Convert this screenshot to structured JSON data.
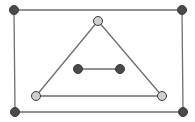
{
  "diagram": {
    "type": "graph",
    "width": 195,
    "height": 122,
    "background": "#ffffff",
    "edge_color": "#6e6e6e",
    "edge_width": 1.3,
    "node_radius": 4.5,
    "node_stroke": "#3a3a3a",
    "node_styles": {
      "dark": {
        "fill": "#4a4a4a"
      },
      "light": {
        "fill": "#cfcfcf"
      }
    },
    "nodes": [
      {
        "id": "outer-top-left",
        "x": 14,
        "y": 10,
        "style": "dark"
      },
      {
        "id": "outer-top-right",
        "x": 182,
        "y": 10,
        "style": "dark"
      },
      {
        "id": "outer-bottom-right",
        "x": 183,
        "y": 112,
        "style": "dark"
      },
      {
        "id": "outer-bottom-left",
        "x": 15,
        "y": 112,
        "style": "dark"
      },
      {
        "id": "triangle-apex",
        "x": 98,
        "y": 21,
        "style": "light"
      },
      {
        "id": "triangle-bottom-left",
        "x": 36,
        "y": 96,
        "style": "light"
      },
      {
        "id": "triangle-bottom-right",
        "x": 162,
        "y": 96,
        "style": "light"
      },
      {
        "id": "inner-left",
        "x": 78,
        "y": 69,
        "style": "dark"
      },
      {
        "id": "inner-right",
        "x": 120,
        "y": 69,
        "style": "dark"
      }
    ],
    "edges": [
      {
        "from": "outer-top-left",
        "to": "outer-top-right"
      },
      {
        "from": "outer-top-right",
        "to": "outer-bottom-right"
      },
      {
        "from": "outer-bottom-right",
        "to": "outer-bottom-left"
      },
      {
        "from": "outer-bottom-left",
        "to": "outer-top-left"
      },
      {
        "from": "triangle-apex",
        "to": "triangle-bottom-left"
      },
      {
        "from": "triangle-bottom-left",
        "to": "triangle-bottom-right"
      },
      {
        "from": "triangle-bottom-right",
        "to": "triangle-apex"
      },
      {
        "from": "inner-left",
        "to": "inner-right"
      }
    ]
  }
}
